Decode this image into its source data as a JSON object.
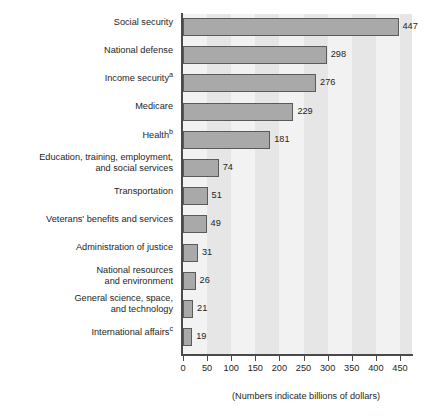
{
  "chart_data": {
    "type": "bar",
    "orientation": "horizontal",
    "title": "",
    "subtitle": "",
    "xlabel": "",
    "ylabel": "",
    "caption": "(Numbers indicate billions of dollars)",
    "units": "billions of dollars",
    "xlim": [
      0,
      475
    ],
    "xticks": [
      0,
      50,
      100,
      150,
      200,
      250,
      300,
      350,
      400,
      450
    ],
    "xtick_labels": [
      "0",
      "50",
      "100",
      "150",
      "200",
      "250",
      "300",
      "350",
      "400",
      "450"
    ],
    "grid": false,
    "banded_background": true,
    "band_interval": 50,
    "legend": null,
    "categories": [
      "Social security",
      "National defense",
      "Income security",
      "Medicare",
      "Health",
      "Education, training, employment,\nand social services",
      "Transportation",
      "Veterans' benefits and services",
      "Administration of justice",
      "National resources\nand environment",
      "General science, space,\nand technology",
      "International affairs"
    ],
    "category_footnotes": [
      "",
      "",
      "a",
      "",
      "b",
      "",
      "",
      "",
      "",
      "",
      "",
      "c"
    ],
    "values": [
      447,
      298,
      276,
      229,
      181,
      74,
      51,
      49,
      31,
      26,
      21,
      19
    ],
    "value_labels": [
      "447",
      "298",
      "276",
      "229",
      "181",
      "74",
      "51",
      "49",
      "31",
      "26",
      "21",
      "19"
    ]
  },
  "style": {
    "bar_fill": "#a9a9a9",
    "bar_stroke": "#5a5a5a",
    "plot_background": "#f2f2f2",
    "band_color": "#e6e6e6",
    "axis_color": "#4a4a4a",
    "text_color": "#1e1e1e",
    "page_background": "#ffffff"
  }
}
